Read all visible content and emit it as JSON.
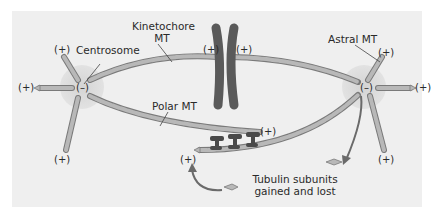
{
  "diagram": {
    "type": "mitotic-spindle",
    "labels": {
      "kinetochore_mt_line1": "Kinetochore",
      "kinetochore_mt_line2": "MT",
      "centrosome": "Centrosome",
      "astral_mt": "Astral MT",
      "polar_mt": "Polar MT",
      "tubulin_line1": "Tubulin subunits",
      "tubulin_line2": "gained and lost"
    },
    "signs": {
      "plus": "(+)",
      "minus": "(–)"
    },
    "colors": {
      "background_panel": "#efefef",
      "centrosome_glow": "#dcdcdc",
      "microtubule_fill": "#b4b4b4",
      "microtubule_stroke": "#7a7a7a",
      "chromosome": "#5a5a5a",
      "motor_protein": "#4a4a4a",
      "arrow": "#6a6a6a",
      "text": "#2a2a2a"
    }
  }
}
